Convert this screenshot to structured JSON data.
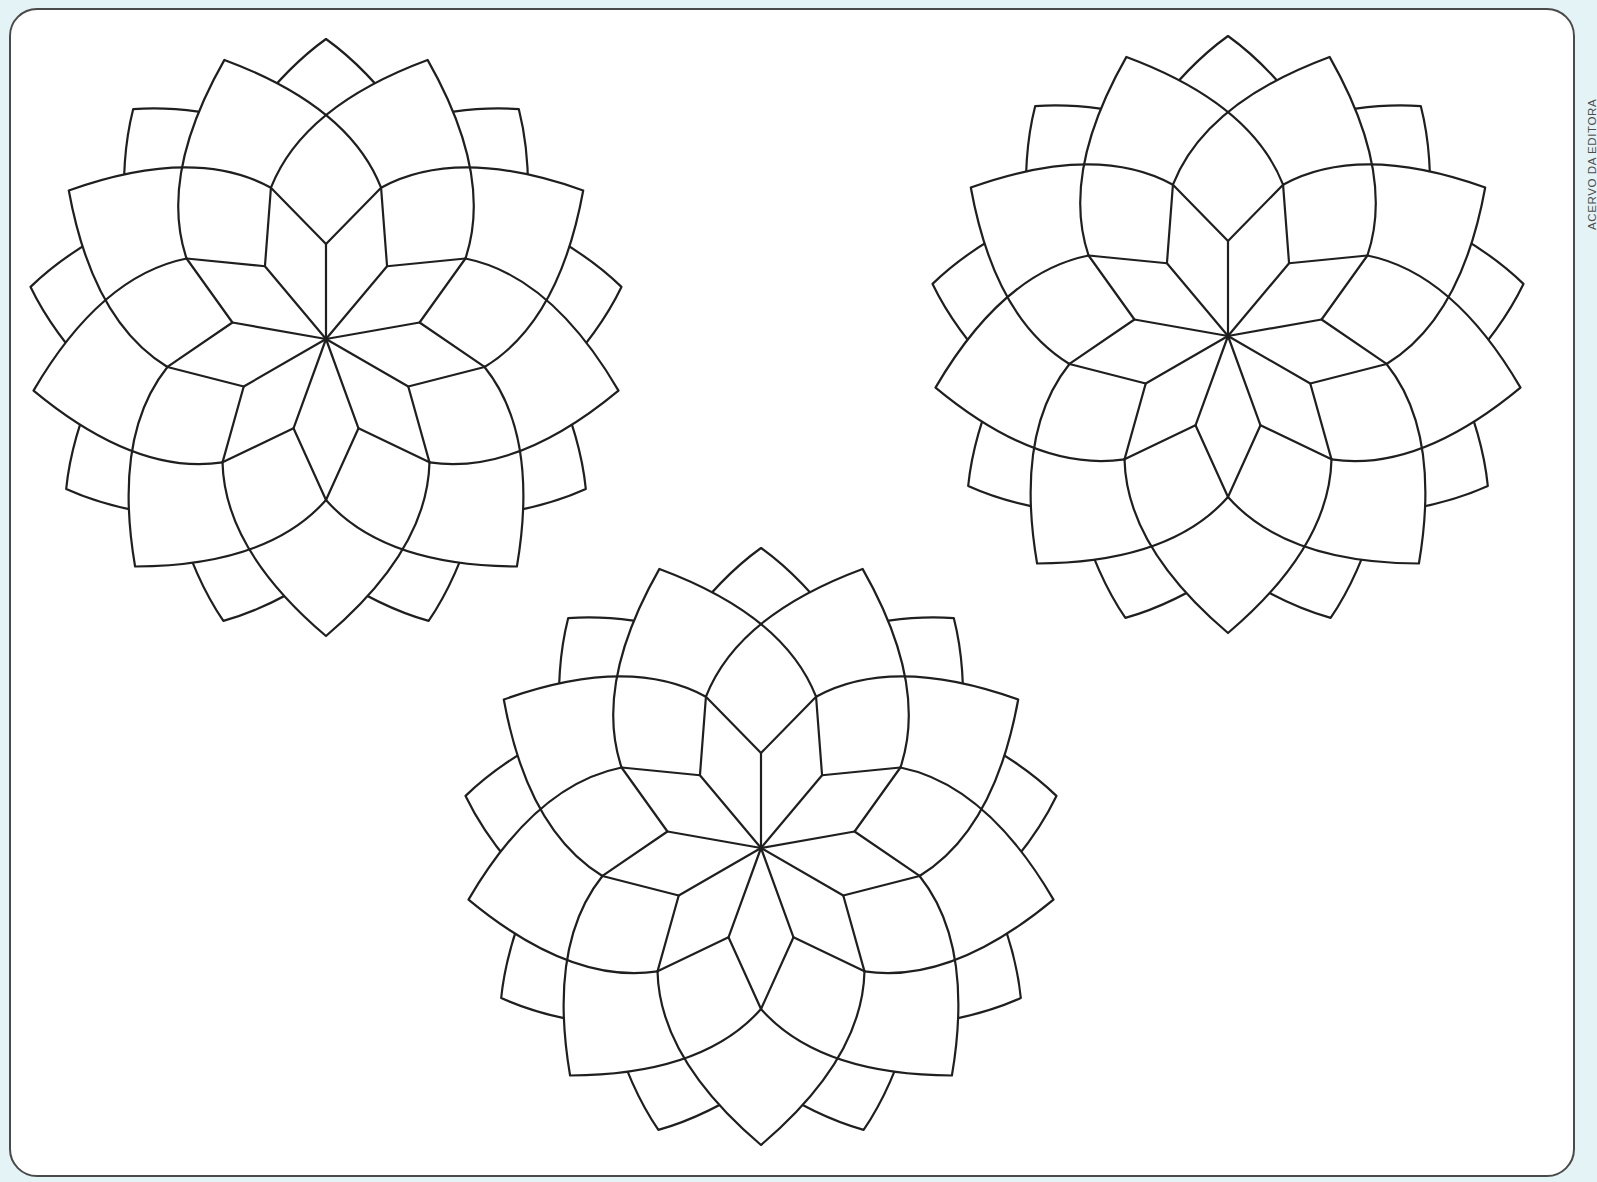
{
  "page": {
    "background_color": "#e4f3f6",
    "frame_color": "#4a4a4a",
    "paper_color": "#ffffff",
    "credit_text": "ACERVO DA EDITORA"
  },
  "mandala_style": {
    "stroke_color": "#1f1f1f",
    "stroke_width": 2.2,
    "fill_color": "#ffffff",
    "folds": 9,
    "start_angle_deg": -90,
    "r_inner_ray": 95,
    "r_rhombus_outer": 161,
    "r_box_outer": 224,
    "r_big_petal_tip": 297,
    "r_small_petal_tip": 300,
    "r_small_petal_side": 232,
    "small_petal_bulge": 0.1
  },
  "mandalas": [
    {
      "name": "mandala-top-left",
      "cx": 326,
      "cy": 339
    },
    {
      "name": "mandala-top-right",
      "cx": 1228,
      "cy": 336
    },
    {
      "name": "mandala-bottom-center",
      "cx": 761,
      "cy": 848
    }
  ]
}
